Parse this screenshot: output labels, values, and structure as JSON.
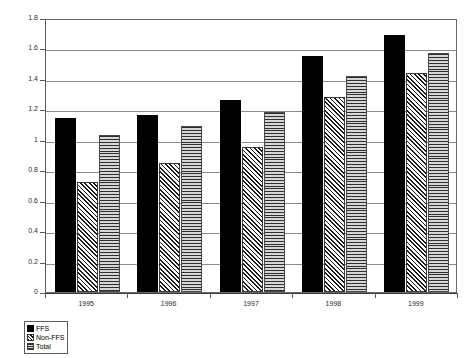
{
  "chart_data": {
    "type": "bar",
    "title": "",
    "subtitle": "",
    "xlabel": "",
    "ylabel": "",
    "categories": [
      "1995",
      "1996",
      "1997",
      "1998",
      "1999"
    ],
    "series": [
      {
        "name": "FFS",
        "values": [
          1.14,
          1.16,
          1.26,
          1.55,
          1.69
        ]
      },
      {
        "name": "Non-FFS",
        "values": [
          0.72,
          0.85,
          0.95,
          1.28,
          1.44
        ]
      },
      {
        "name": "Total",
        "values": [
          1.03,
          1.09,
          1.18,
          1.42,
          1.57
        ]
      }
    ],
    "ylim": [
      0,
      1.8
    ],
    "ytick_labels": [
      "0",
      "0.2",
      "0.4",
      "0.6",
      "0.8",
      "1",
      "1.2",
      "1.4",
      "1.6",
      "1.8"
    ],
    "ytick_values": [
      0,
      0.2,
      0.4,
      0.6,
      0.8,
      1,
      1.2,
      1.4,
      1.6,
      1.8
    ],
    "grid": true,
    "legend_position": "bottom-left",
    "legend_entries": [
      "FFS",
      "Non-FFS",
      "Total"
    ],
    "colors": {
      "ffs": "#000000",
      "nonffs": "#ffffff",
      "total": "#c9c9c9",
      "gridline": "#8a8a8a",
      "axis": "#5a5a5a",
      "text": "#2b2b2b"
    },
    "patterns": {
      "ffs": "solid-black",
      "nonffs": "diagonal-hatch",
      "total": "horizontal-hatch"
    }
  }
}
